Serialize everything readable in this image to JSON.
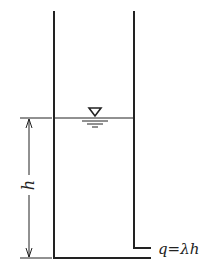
{
  "diagram": {
    "type": "tank-outflow-schematic",
    "labels": {
      "height": "h",
      "outflow": "q=λh"
    },
    "symbols": {
      "water_surface": "inverted-triangle-free-surface-symbol"
    },
    "colors": {
      "line": "#222222",
      "background": "#ffffff"
    }
  }
}
